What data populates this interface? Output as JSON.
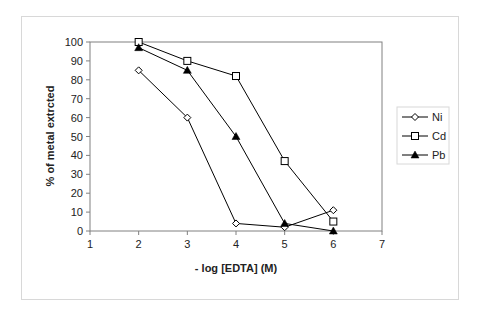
{
  "chart_data": {
    "type": "line",
    "title": "",
    "xlabel": "- log [EDTA] (M)",
    "ylabel": "% of metal extrcted",
    "xlim": [
      1,
      7
    ],
    "ylim": [
      0,
      100
    ],
    "x_ticks": [
      1,
      2,
      3,
      4,
      5,
      6,
      7
    ],
    "y_ticks": [
      0,
      10,
      20,
      30,
      40,
      50,
      60,
      70,
      80,
      90,
      100
    ],
    "grid": false,
    "legend_position": "right",
    "x": [
      2,
      3,
      4,
      5,
      6
    ],
    "series": [
      {
        "name": "Ni",
        "marker": "diamond-open",
        "values": [
          85,
          60,
          4,
          2,
          11
        ]
      },
      {
        "name": "Cd",
        "marker": "square-open",
        "values": [
          100,
          90,
          82,
          37,
          5
        ]
      },
      {
        "name": "Pb",
        "marker": "triangle-filled",
        "values": [
          97,
          85,
          50,
          4,
          0
        ]
      }
    ]
  },
  "colors": {
    "line": "#000000",
    "axis": "#808080",
    "frame": "#d8d8d8"
  }
}
